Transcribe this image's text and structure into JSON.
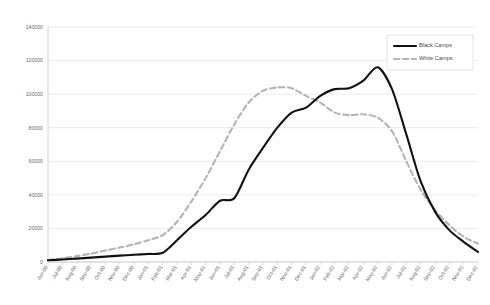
{
  "chart_data": {
    "type": "line",
    "title": "",
    "xlabel": "",
    "ylabel": "",
    "ylim": [
      0,
      140000
    ],
    "ytick_labels": [
      "0",
      "20000",
      "40000",
      "60000",
      "80000",
      "100000",
      "120000",
      "140000"
    ],
    "yticks": [
      0,
      20000,
      40000,
      60000,
      80000,
      100000,
      120000,
      140000
    ],
    "grid": true,
    "legend_position": "top-right",
    "categories": [
      "Jun-00",
      "Jul-00",
      "Aug-00",
      "Sep-00",
      "Oct-00",
      "Nov-00",
      "Dec-00",
      "Jan-01",
      "Feb-01",
      "Mar-01",
      "Apr-01",
      "May-01",
      "Jun-01",
      "Jul-01",
      "Aug-01",
      "Sep-01",
      "Oct-01",
      "Nov-01",
      "Dec-01",
      "Jan-02",
      "Feb-02",
      "Mar-02",
      "Apr-02",
      "May-02",
      "Jun-02",
      "Jul-02",
      "Aug-02",
      "Sep-02",
      "Oct-02",
      "Nov-02",
      "Dec-02"
    ],
    "series": [
      {
        "name": "Black Camps",
        "color": "#111111",
        "style": "solid",
        "values": [
          1000,
          1500,
          2000,
          2600,
          3200,
          3800,
          4300,
          4800,
          5500,
          13000,
          21000,
          28000,
          36500,
          38000,
          55000,
          68000,
          80000,
          89000,
          92000,
          99000,
          103000,
          103500,
          108000,
          116000,
          103000,
          76000,
          48000,
          30000,
          19000,
          12000,
          6000
        ]
      },
      {
        "name": "White Camps",
        "color": "#b4b4b4",
        "style": "dashed",
        "values": [
          1200,
          2200,
          3500,
          5000,
          6800,
          8600,
          10500,
          13000,
          16000,
          24000,
          36000,
          50000,
          66000,
          82000,
          95000,
          102000,
          104000,
          103500,
          99000,
          95000,
          89000,
          87500,
          88000,
          86000,
          78000,
          60000,
          43000,
          31000,
          22000,
          15000,
          11000
        ]
      }
    ]
  },
  "legend": {
    "items": [
      {
        "label": "Black Camps"
      },
      {
        "label": "White Camps"
      }
    ]
  }
}
